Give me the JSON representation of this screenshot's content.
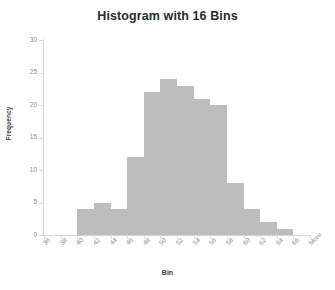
{
  "chart_data": {
    "type": "bar",
    "title": "Histogram with 16 Bins",
    "xlabel": "Bin",
    "ylabel": "Frequency",
    "categories": [
      "36",
      "38",
      "40",
      "42",
      "44",
      "46",
      "48",
      "50",
      "52",
      "54",
      "56",
      "58",
      "60",
      "62",
      "64",
      "66",
      "More"
    ],
    "bin_labels": [
      "36",
      "38",
      "40",
      "42",
      "44",
      "46",
      "48",
      "50",
      "52",
      "54",
      "56",
      "58",
      "60",
      "62",
      "64",
      "66",
      "More"
    ],
    "values": [
      0,
      0,
      4,
      5,
      4,
      12,
      22,
      24,
      23,
      21,
      20,
      8,
      4,
      2,
      1,
      0,
      0
    ],
    "series": [
      {
        "name": "Frequency",
        "values": [
          0,
          0,
          4,
          5,
          4,
          12,
          22,
          24,
          23,
          21,
          20,
          8,
          4,
          2,
          1,
          0,
          0
        ]
      }
    ],
    "ylim": [
      0,
      30
    ],
    "yticks": [
      0,
      5,
      10,
      15,
      20,
      25,
      30
    ],
    "ytick_labels": [
      "0",
      "5",
      "10",
      "15",
      "20",
      "25",
      "30"
    ],
    "grid": false,
    "legend": false,
    "bar_color": "#bdbdbd",
    "axis_color": "#d4d4d4",
    "tick_label_color": "#8a8a8a",
    "title_color": "#2b2b2b"
  }
}
